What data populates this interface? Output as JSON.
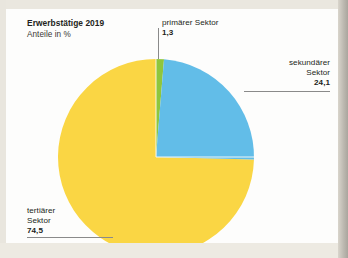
{
  "figure": {
    "headline_main": "Erwerbstätige 2019",
    "headline_sub": "Anteile in %"
  },
  "callouts": {
    "primaer": {
      "label": "primärer Sektor",
      "value": "1,3"
    },
    "sekundaer": {
      "label_line1": "sekundärer",
      "label_line2": "Sektor",
      "value": "24,1"
    },
    "tertiaer": {
      "label_line1": "tertiärer",
      "label_line2": "Sektor",
      "value": "74,5"
    }
  },
  "colors": {
    "primaer": "#8fc63d",
    "sekundaer": "#62bde8",
    "tertiaer": "#fad644",
    "leader": "#8a8a8a",
    "text": "#231f20",
    "card": "#fdfdfc",
    "paper": "#efece4"
  },
  "chart_data": {
    "type": "pie",
    "title": "Erwerbstätige 2019",
    "subtitle": "Anteile in %",
    "unit": "%",
    "categories": [
      "primärer Sektor",
      "sekundärer Sektor",
      "tertiärer Sektor"
    ],
    "values": [
      1.3,
      24.1,
      74.5
    ],
    "value_labels": [
      "1,3",
      "24,1",
      "74,5"
    ],
    "colors": [
      "#8fc63d",
      "#62bde8",
      "#fad644"
    ],
    "start_angle_deg": 0,
    "direction": "clockwise",
    "legend": "callout-labels",
    "grid": false
  }
}
